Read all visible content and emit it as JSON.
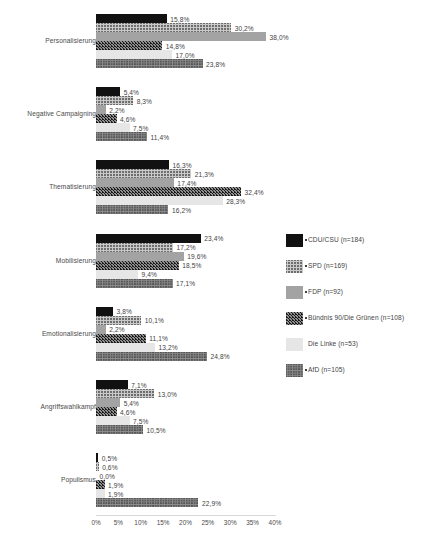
{
  "chart_data": {
    "type": "bar",
    "orientation": "horizontal",
    "title": "",
    "subtitle": "",
    "xlabel": "",
    "ylabel": "",
    "xlim": [
      0,
      40
    ],
    "xtick_labels": [
      "0%",
      "5%",
      "10%",
      "15%",
      "20%",
      "25%",
      "30%",
      "35%",
      "40%"
    ],
    "xtick_values": [
      0,
      5,
      10,
      15,
      20,
      25,
      30,
      35,
      40
    ],
    "grid": false,
    "legend_position": "right",
    "value_label_suffix": "%",
    "decimal_separator": ",",
    "categories": [
      "Personalisierung",
      "Negative Campaigning",
      "Thematisierung",
      "Mobilisierung",
      "Emotionalisierung",
      "Angriffswahlkampf",
      "Populismus"
    ],
    "series": [
      {
        "name": "CDU/CSU (n=184)",
        "pattern": "solid-black",
        "color": "#111111",
        "values": [
          15.8,
          5.4,
          16.3,
          23.4,
          3.8,
          7.1,
          0.5
        ],
        "labels": [
          "15,8%",
          "5,4%",
          "16,3%",
          "23,4%",
          "3,8%",
          "7,1%",
          "0,5%"
        ]
      },
      {
        "name": "SPD (n=169)",
        "pattern": "light-checker",
        "color": "#c9c9c9",
        "values": [
          30.2,
          8.3,
          21.3,
          17.2,
          10.1,
          13.0,
          0.6
        ],
        "labels": [
          "30,2%",
          "8,3%",
          "21,3%",
          "17,2%",
          "10,1%",
          "13,0%",
          "0,6%"
        ]
      },
      {
        "name": "FDP (n=92)",
        "pattern": "solid-gray",
        "color": "#a3a3a3",
        "values": [
          38.0,
          2.2,
          17.4,
          19.6,
          2.2,
          5.4,
          0.0
        ],
        "labels": [
          "38,0%",
          "2,2%",
          "17,4%",
          "19,6%",
          "2,2%",
          "5,4%",
          "0,0%"
        ]
      },
      {
        "name": "Bündnis 90/Die Grünen (n=108)",
        "pattern": "dark-zigzag",
        "color": "#3d3d3d",
        "values": [
          14.8,
          4.6,
          32.4,
          18.5,
          11.1,
          4.6,
          1.9
        ],
        "labels": [
          "14,8%",
          "4,6%",
          "32,4%",
          "18,5%",
          "11,1%",
          "4,6%",
          "1,9%"
        ]
      },
      {
        "name": "Die Linke (n=53)",
        "pattern": "very-light",
        "color": "#e6e6e6",
        "values": [
          17.0,
          7.5,
          28.3,
          9.4,
          13.2,
          7.5,
          1.9
        ],
        "labels": [
          "17,0%",
          "7,5%",
          "28,3%",
          "9,4%",
          "13,2%",
          "7,5%",
          "1,9%"
        ]
      },
      {
        "name": "AfD (n=105)",
        "pattern": "mid-crosshatch",
        "color": "#8c8c8c",
        "values": [
          23.8,
          11.4,
          16.2,
          17.1,
          24.8,
          10.5,
          22.9
        ],
        "labels": [
          "23,8%",
          "11,4%",
          "16,2%",
          "17,1%",
          "24,8%",
          "10,5%",
          "22,9%"
        ]
      }
    ]
  }
}
